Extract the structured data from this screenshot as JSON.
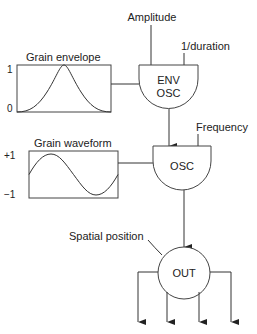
{
  "diagram": {
    "inputs": {
      "amplitude": "Amplitude",
      "duration": "1/duration",
      "frequency": "Frequency",
      "spatial": "Spatial position"
    },
    "tables": {
      "envelope": {
        "label": "Grain envelope",
        "y_max": "1",
        "y_min": "0",
        "shape": "bell"
      },
      "waveform": {
        "label": "Grain waveform",
        "y_max": "+1",
        "y_min": "−1",
        "shape": "sine"
      }
    },
    "nodes": {
      "env_osc_line1": "ENV",
      "env_osc_line2": "OSC",
      "osc": "OSC",
      "out": "OUT"
    },
    "outputs_count": 4,
    "colors": {
      "stroke": "#333333",
      "text": "#222222",
      "background": "#ffffff"
    }
  }
}
